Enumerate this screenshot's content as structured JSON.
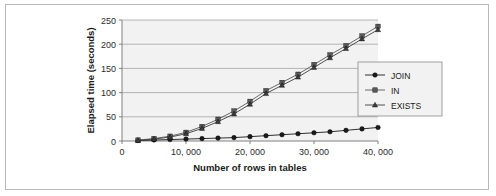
{
  "figure": {
    "background_color": "#ffffff",
    "frame_color": "#b9b9b9",
    "plot_background_color": "#f2f2f2",
    "gridline_color": "#9a9a9a",
    "axis_color": "#808080"
  },
  "chart_data": {
    "type": "line",
    "title": "",
    "xlabel": "Number of rows in tables",
    "ylabel": "Elapsed time (seconds)",
    "xlim": [
      0,
      40000
    ],
    "ylim": [
      0,
      250
    ],
    "xticks": [
      0,
      10000,
      20000,
      30000,
      40000
    ],
    "xtick_labels": [
      "0",
      "10, 000",
      "20, 000",
      "30, 000",
      "40, 000"
    ],
    "yticks": [
      0,
      50,
      100,
      150,
      200,
      250
    ],
    "ytick_labels": [
      "0",
      "50",
      "100",
      "150",
      "200",
      "250"
    ],
    "grid": "horizontal",
    "legend_position": "right-middle",
    "x": [
      2500,
      5000,
      7500,
      10000,
      12500,
      15000,
      17500,
      20000,
      22500,
      25000,
      27500,
      30000,
      32500,
      35000,
      37500,
      40000
    ],
    "series": [
      {
        "name": "JOIN",
        "marker": "circle",
        "color": "#1a1a1a",
        "values": [
          1,
          2,
          3,
          4,
          5,
          6,
          7,
          9,
          11,
          13,
          15,
          17,
          19,
          22,
          25,
          28
        ]
      },
      {
        "name": "IN",
        "marker": "square",
        "color": "#595959",
        "values": [
          2,
          5,
          10,
          18,
          30,
          45,
          62,
          82,
          104,
          121,
          138,
          158,
          178,
          197,
          217,
          237
        ]
      },
      {
        "name": "EXISTS",
        "marker": "triangle",
        "color": "#3d3d3d",
        "values": [
          1,
          4,
          8,
          15,
          26,
          40,
          56,
          76,
          98,
          115,
          132,
          152,
          172,
          191,
          211,
          230
        ]
      }
    ]
  },
  "legend": {
    "entries": [
      {
        "label": "JOIN",
        "marker": "circle"
      },
      {
        "label": "IN",
        "marker": "square"
      },
      {
        "label": "EXISTS",
        "marker": "triangle"
      }
    ]
  }
}
